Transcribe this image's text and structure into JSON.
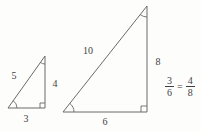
{
  "figure": {
    "left_triangle": {
      "hypotenuse_label": "5",
      "vertical_label": "4",
      "base_label": "3"
    },
    "right_triangle": {
      "hypotenuse_label": "10",
      "vertical_label": "8",
      "base_label": "6"
    },
    "equation": {
      "lhs_numerator": "3",
      "lhs_denominator": "6",
      "equals_sign": "=",
      "rhs_numerator": "4",
      "rhs_denominator": "8"
    },
    "colors": {
      "line": "#6a6a6a",
      "text": "#3f3f3f",
      "background": "#fdfdfc"
    }
  }
}
